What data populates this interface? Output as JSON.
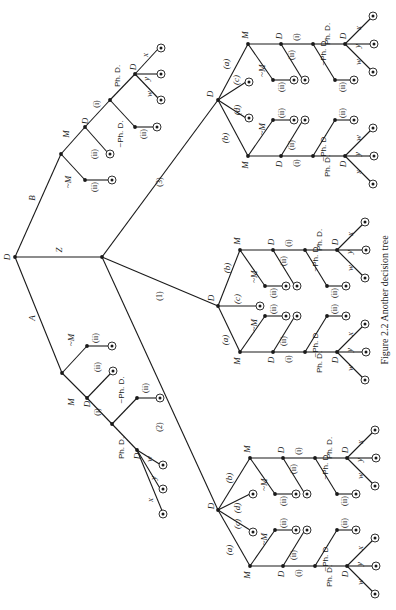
{
  "figure": {
    "caption": "Figure 2.2   Another decision tree",
    "orientation": "rotated-90-cw",
    "root_label": "D",
    "top_branches": [
      {
        "label": "A"
      },
      {
        "label": "Z"
      },
      {
        "label": "B"
      }
    ],
    "z_branches": [
      {
        "label": "(1)"
      },
      {
        "label": "(2)"
      },
      {
        "label": "(3)"
      }
    ],
    "subtree_branch_labels": [
      "(a)",
      "(b)",
      "(c)",
      "(d)"
    ],
    "node_labels": {
      "decision": "D",
      "marry": "M",
      "not_marry": "~M",
      "phd": "Ph. D.",
      "not_phd": "~Ph. D.",
      "i": "(i)",
      "ii": "(ii)",
      "x": "x",
      "y": "y",
      "w": "w"
    }
  },
  "chart_data": {
    "type": "tree",
    "title": "Another decision tree",
    "nodes": [
      {
        "id": "root",
        "label": "D",
        "children": [
          "A",
          "Z",
          "B"
        ]
      },
      {
        "id": "A",
        "edge": "A",
        "children": [
          "M",
          "~M"
        ]
      },
      {
        "id": "B",
        "edge": "B",
        "children": [
          "M",
          "~M"
        ]
      },
      {
        "id": "Z",
        "edge": "Z",
        "children": [
          "(1)",
          "(2)",
          "(3)"
        ]
      },
      {
        "id": "(1)",
        "label": "D",
        "children": [
          "(a)",
          "(b)",
          "(c)"
        ]
      },
      {
        "id": "(2)",
        "label": "D",
        "children": [
          "(a)",
          "(b)",
          "(c)",
          "(d)"
        ]
      },
      {
        "id": "(3)",
        "label": "D",
        "children": [
          "(a)",
          "(b)",
          "(c)",
          "(d)"
        ]
      }
    ]
  }
}
